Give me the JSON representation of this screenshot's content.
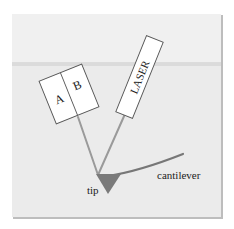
{
  "diagram": {
    "type": "afm-optical-lever-schematic",
    "colors": {
      "page_background": "#ffffff",
      "panel_background_upper": "#efefef",
      "panel_background_lower": "#e9e9e9",
      "horizon_band": "#d8d8d8",
      "panel_shadow": "#b8b8b8",
      "box_fill": "#ffffff",
      "box_stroke": "#555555",
      "beam": "#9a9a9a",
      "tip_fill": "#7a7a7a",
      "cantilever": "#777777",
      "text": "#222222"
    },
    "detector": {
      "label_a": "A",
      "label_b": "B"
    },
    "laser": {
      "label": "LASER"
    },
    "tip": {
      "label": "tip"
    },
    "cantilever": {
      "label": "cantilever"
    }
  }
}
